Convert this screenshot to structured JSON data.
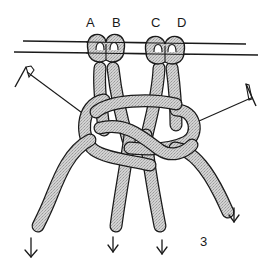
{
  "diagram": {
    "type": "macrame-knot-illustration",
    "figure_number": "3",
    "cord_labels": [
      {
        "id": "A",
        "label": "A"
      },
      {
        "id": "B",
        "label": "B"
      },
      {
        "id": "C",
        "label": "C"
      },
      {
        "id": "D",
        "label": "D"
      }
    ],
    "elements": {
      "holding_cord": "horizontal dowel/holding cord with lark's head mounted cords",
      "pins": [
        "left-pin",
        "right-pin"
      ],
      "arrows": [
        "down-arrow",
        "down-arrow",
        "down-arrow",
        "down-arrow"
      ]
    },
    "colors": {
      "cord_fill": "#c8c8c8",
      "cord_outline": "#1a1a1a",
      "background": "#ffffff"
    }
  }
}
